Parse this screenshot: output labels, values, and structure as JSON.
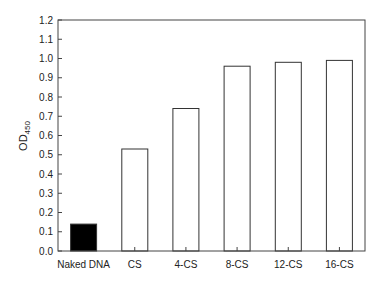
{
  "chart_data": {
    "type": "bar",
    "title": "",
    "xlabel": "",
    "ylabel": "OD450",
    "ylabel_main": "OD",
    "ylabel_sub": "450",
    "categories": [
      "Naked DNA",
      "CS",
      "4-CS",
      "8-CS",
      "12-CS",
      "16-CS"
    ],
    "values": [
      0.14,
      0.53,
      0.74,
      0.96,
      0.98,
      0.99
    ],
    "bar_fills": [
      "#000000",
      "#ffffff",
      "#ffffff",
      "#ffffff",
      "#ffffff",
      "#ffffff"
    ],
    "ylim": [
      0.0,
      1.2
    ],
    "yticks": [
      "0.0",
      "0.1",
      "0.2",
      "0.3",
      "0.4",
      "0.5",
      "0.6",
      "0.7",
      "0.8",
      "0.9",
      "1.0",
      "1.1",
      "1.2"
    ],
    "grid": false,
    "legend": null,
    "frame": "box"
  }
}
